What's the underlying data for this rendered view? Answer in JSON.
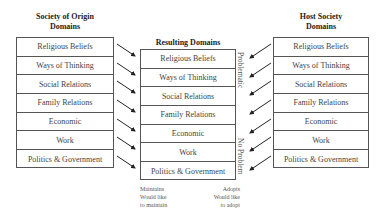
{
  "left": {
    "title_line1": "Society of Origin",
    "title_line2": "Domains",
    "items": [
      "Religious Beliefs",
      "Ways of Thinking",
      "Social Relations",
      "Family Relations",
      "Economic",
      "Work",
      "Politics & Government"
    ]
  },
  "center": {
    "title": "Resulting Domains",
    "items": [
      "Religious Beliefs",
      "Ways of Thinking",
      "Social Relations",
      "Family Relations",
      "Economic",
      "Work",
      "Politics & Government"
    ],
    "label_top": "Problematic",
    "label_bottom": "No Problem"
  },
  "right": {
    "title_line1": "Host Society",
    "title_line2": "Domains",
    "items": [
      "Religious Beliefs",
      "Ways of Thinking",
      "Social Relations",
      "Family Relations",
      "Economic",
      "Work",
      "Politics & Government"
    ]
  },
  "footnotes": {
    "left": {
      "line1": "Maintains",
      "line2": "Would like",
      "line3": "to maintain"
    },
    "right": {
      "line1": "Adopts",
      "line2": "Would like",
      "line3": "to adopt"
    }
  }
}
